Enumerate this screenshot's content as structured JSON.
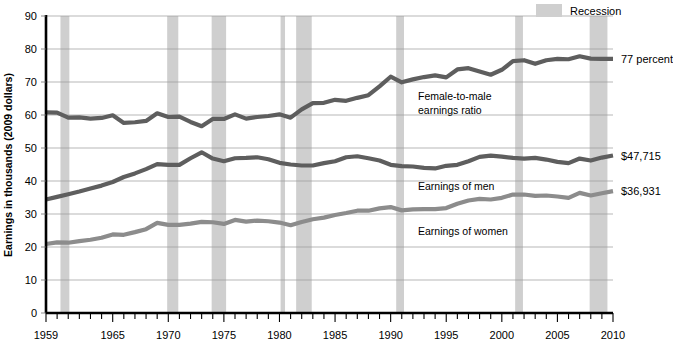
{
  "legend": {
    "position": "top-right",
    "items": [
      {
        "label": "Recession",
        "swatch_color": "#cfcfcf",
        "type": "band"
      }
    ]
  },
  "annotations": [
    {
      "name": "ratio-annotation",
      "line1": "Female-to-male",
      "line2": "earnings ratio"
    },
    {
      "name": "men-annotation",
      "line1": "Earnings of men",
      "line2": ""
    },
    {
      "name": "women-annotation",
      "line1": "Earnings of women",
      "line2": ""
    }
  ],
  "end_labels": [
    {
      "name": "ratio-end-label",
      "text": "77 percent",
      "value": 77
    },
    {
      "name": "men-end-label",
      "text": "$47,715",
      "value": 47.715
    },
    {
      "name": "women-end-label",
      "text": "$36,931",
      "value": 36.931
    }
  ],
  "chart_data": {
    "type": "line",
    "title": "",
    "subtitle": "",
    "xlabel": "",
    "ylabel": "Earnings in thousands (2009 dollars)",
    "xlim": [
      1959,
      2010
    ],
    "ylim": [
      0,
      90
    ],
    "yticks": [
      0,
      10,
      20,
      30,
      40,
      50,
      60,
      70,
      80,
      90
    ],
    "ytick_labels": [
      "0",
      "10",
      "20",
      "30",
      "40",
      "50",
      "60",
      "70",
      "80",
      "90"
    ],
    "xticks": [
      1959,
      1965,
      1970,
      1975,
      1980,
      1985,
      1990,
      1995,
      2000,
      2005,
      2010
    ],
    "xtick_labels": [
      "1959",
      "1965",
      "1970",
      "1975",
      "1980",
      "1985",
      "1990",
      "1995",
      "2000",
      "2005",
      "2010"
    ],
    "x_minor_tick_interval": 1,
    "grid": true,
    "grid_axis": "y",
    "legend_position": "top-right",
    "x": [
      1959,
      1960,
      1961,
      1962,
      1963,
      1964,
      1965,
      1966,
      1967,
      1968,
      1969,
      1970,
      1971,
      1972,
      1973,
      1974,
      1975,
      1976,
      1977,
      1978,
      1979,
      1980,
      1981,
      1982,
      1983,
      1984,
      1985,
      1986,
      1987,
      1988,
      1989,
      1990,
      1991,
      1992,
      1993,
      1994,
      1995,
      1996,
      1997,
      1998,
      1999,
      2000,
      2001,
      2002,
      2003,
      2004,
      2005,
      2006,
      2007,
      2008,
      2009,
      2010
    ],
    "series": [
      {
        "name": "Female-to-male earnings ratio",
        "unit": "percent",
        "color": "#5e5e5e",
        "values": [
          60.8,
          60.7,
          59.2,
          59.3,
          58.9,
          59.1,
          59.9,
          57.6,
          57.8,
          58.2,
          60.5,
          59.4,
          59.5,
          57.9,
          56.6,
          58.8,
          58.8,
          60.2,
          58.9,
          59.4,
          59.7,
          60.2,
          59.2,
          61.7,
          63.6,
          63.7,
          64.6,
          64.3,
          65.2,
          66.0,
          68.7,
          71.6,
          69.9,
          70.8,
          71.5,
          72.0,
          71.4,
          73.8,
          74.2,
          73.2,
          72.2,
          73.7,
          76.3,
          76.6,
          75.5,
          76.6,
          77.0,
          76.9,
          77.8,
          77.1,
          77.0,
          77.0
        ]
      },
      {
        "name": "Earnings of men",
        "unit": "thousands of 2009 dollars",
        "color": "#5e5e5e",
        "values": [
          34.4,
          35.2,
          36.0,
          36.8,
          37.7,
          38.6,
          39.7,
          41.2,
          42.3,
          43.6,
          45.1,
          44.9,
          44.9,
          46.9,
          48.7,
          46.8,
          46.0,
          46.9,
          47.0,
          47.2,
          46.6,
          45.5,
          45.0,
          44.7,
          44.7,
          45.4,
          46.0,
          47.2,
          47.5,
          46.9,
          46.2,
          44.9,
          44.5,
          44.4,
          44.0,
          43.8,
          44.6,
          44.9,
          46.0,
          47.3,
          47.7,
          47.4,
          47.0,
          46.8,
          47.0,
          46.5,
          45.8,
          45.4,
          46.8,
          46.2,
          47.1,
          47.715
        ]
      },
      {
        "name": "Earnings of women",
        "unit": "thousands of 2009 dollars",
        "color": "#8c8c8c",
        "values": [
          20.9,
          21.4,
          21.3,
          21.8,
          22.2,
          22.8,
          23.8,
          23.7,
          24.5,
          25.4,
          27.3,
          26.7,
          26.7,
          27.1,
          27.6,
          27.5,
          27.0,
          28.2,
          27.7,
          28.0,
          27.8,
          27.4,
          26.6,
          27.6,
          28.4,
          28.9,
          29.7,
          30.3,
          31.0,
          31.0,
          31.7,
          32.1,
          31.1,
          31.4,
          31.5,
          31.5,
          31.8,
          33.1,
          34.1,
          34.6,
          34.4,
          34.9,
          35.9,
          35.9,
          35.5,
          35.6,
          35.3,
          34.9,
          36.4,
          35.6,
          36.3,
          36.931
        ]
      }
    ],
    "recessions": [
      {
        "start": 1960.3,
        "end": 1961.1
      },
      {
        "start": 1969.9,
        "end": 1970.9
      },
      {
        "start": 1973.9,
        "end": 1975.2
      },
      {
        "start": 1980.1,
        "end": 1980.5
      },
      {
        "start": 1981.5,
        "end": 1982.9
      },
      {
        "start": 1990.5,
        "end": 1991.2
      },
      {
        "start": 2001.2,
        "end": 2001.9
      },
      {
        "start": 2007.9,
        "end": 2009.5
      }
    ]
  }
}
